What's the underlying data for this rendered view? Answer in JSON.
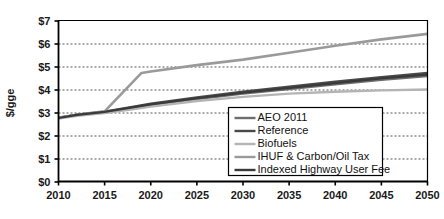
{
  "chart_data": {
    "type": "line",
    "title": "",
    "xlabel": "",
    "ylabel": "$/gge",
    "xlim": [
      2010,
      2050
    ],
    "ylim": [
      0,
      7
    ],
    "grid": true,
    "legend_position": "inside-bottom-right",
    "x_ticks": [
      "2010",
      "2015",
      "2020",
      "2025",
      "2030",
      "2035",
      "2040",
      "2045",
      "2050"
    ],
    "x_tick_values": [
      2010,
      2015,
      2020,
      2025,
      2030,
      2035,
      2040,
      2045,
      2050
    ],
    "y_ticks": [
      "$0",
      "$1",
      "$2",
      "$3",
      "$4",
      "$5",
      "$6",
      "$7"
    ],
    "y_tick_values": [
      0,
      1,
      2,
      3,
      4,
      5,
      6,
      7
    ],
    "x": [
      2010,
      2015,
      2020,
      2025,
      2030,
      2035,
      2040,
      2045,
      2050
    ],
    "series": [
      {
        "name": "AEO 2011",
        "color": "#6e6e6e",
        "width": 2.2,
        "points": [
          [
            2010,
            2.78
          ],
          [
            2012,
            2.9
          ],
          [
            2015,
            3.02
          ],
          [
            2018,
            3.2
          ],
          [
            2020,
            3.32
          ],
          [
            2025,
            3.58
          ],
          [
            2030,
            3.82
          ],
          [
            2035,
            4.02
          ],
          [
            2040,
            4.22
          ],
          [
            2045,
            4.42
          ],
          [
            2050,
            4.58
          ]
        ]
      },
      {
        "name": "Reference",
        "color": "#4a4a4a",
        "width": 2.4,
        "points": [
          [
            2010,
            2.76
          ],
          [
            2012,
            2.9
          ],
          [
            2015,
            3.04
          ],
          [
            2018,
            3.24
          ],
          [
            2020,
            3.38
          ],
          [
            2025,
            3.66
          ],
          [
            2030,
            3.9
          ],
          [
            2035,
            4.12
          ],
          [
            2040,
            4.34
          ],
          [
            2045,
            4.54
          ],
          [
            2050,
            4.72
          ]
        ]
      },
      {
        "name": "Biofuels",
        "color": "#b4b4b4",
        "width": 2.4,
        "points": [
          [
            2010,
            2.74
          ],
          [
            2012,
            2.86
          ],
          [
            2015,
            2.98
          ],
          [
            2018,
            3.14
          ],
          [
            2020,
            3.26
          ],
          [
            2025,
            3.5
          ],
          [
            2030,
            3.68
          ],
          [
            2035,
            3.82
          ],
          [
            2040,
            3.9
          ],
          [
            2045,
            3.96
          ],
          [
            2050,
            4.0
          ]
        ]
      },
      {
        "name": "IHUF & Carbon/Oil Tax",
        "color": "#9a9a9a",
        "width": 2.6,
        "points": [
          [
            2010,
            2.78
          ],
          [
            2013,
            2.95
          ],
          [
            2015,
            3.05
          ],
          [
            2019,
            4.72
          ],
          [
            2020,
            4.78
          ],
          [
            2025,
            5.06
          ],
          [
            2030,
            5.3
          ],
          [
            2035,
            5.6
          ],
          [
            2040,
            5.9
          ],
          [
            2045,
            6.18
          ],
          [
            2050,
            6.42
          ]
        ]
      },
      {
        "name": "Indexed Highway User Fee",
        "color": "#3a3a3a",
        "width": 2.2,
        "points": [
          [
            2010,
            2.76
          ],
          [
            2012,
            2.9
          ],
          [
            2015,
            3.03
          ],
          [
            2018,
            3.22
          ],
          [
            2020,
            3.35
          ],
          [
            2025,
            3.62
          ],
          [
            2030,
            3.86
          ],
          [
            2035,
            4.07
          ],
          [
            2040,
            4.28
          ],
          [
            2045,
            4.48
          ],
          [
            2050,
            4.65
          ]
        ]
      }
    ]
  },
  "legend": {
    "items": [
      {
        "label": "AEO 2011",
        "color": "#6e6e6e"
      },
      {
        "label": "Reference",
        "color": "#4a4a4a"
      },
      {
        "label": "Biofuels",
        "color": "#b4b4b4"
      },
      {
        "label": "IHUF & Carbon/Oil Tax",
        "color": "#9a9a9a"
      },
      {
        "label": "Indexed Highway User Fee",
        "color": "#3a3a3a"
      }
    ]
  },
  "axes": {
    "y_title": "$/gge"
  }
}
